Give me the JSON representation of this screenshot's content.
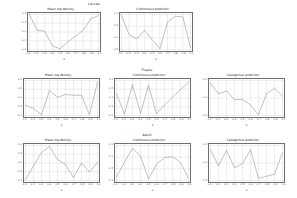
{
  "figure": {
    "background": "#ffffff",
    "line_color": "#8e8e8e",
    "grid_color": "#cfcfcf",
    "axis_color": "#6e6e6e"
  },
  "columns": {
    "density": "Mean log density",
    "continuous": "Continuous predictor",
    "categorical": "Categorical predictor"
  },
  "rows": {
    "larvae": "Larvae",
    "pupae": "Pupae",
    "adult": "Adult"
  },
  "axis": {
    "xlabel": "x"
  },
  "chart_data": [
    {
      "id": "larvae-density",
      "type": "line",
      "title": "Mean log density",
      "group": "Larvae",
      "xlabel": "x",
      "ylabel": "",
      "x": [
        0.1,
        0.2,
        0.3,
        0.4,
        0.5,
        0.6,
        0.7,
        0.8,
        0.9,
        1.0
      ],
      "xticklabels": [
        "0.1",
        "0.2",
        "0.3",
        "0.4",
        "0.5",
        "0.6",
        "0.7",
        "0.8",
        "0.9",
        "1.0"
      ],
      "values": [
        1.0,
        0.55,
        0.52,
        0.1,
        0.02,
        0.22,
        0.38,
        0.55,
        0.88,
        0.97
      ],
      "yticklabels": [
        "-0.4",
        "-0.2",
        "0.0",
        "0.2",
        "0.4"
      ],
      "ylim": [
        0,
        1
      ],
      "grid": true
    },
    {
      "id": "larvae-continuous",
      "type": "line",
      "title": "Continuous predictor",
      "group": "Larvae",
      "xlabel": "x",
      "ylabel": "",
      "x": [
        0.1,
        0.2,
        0.3,
        0.4,
        0.5,
        0.6,
        0.7,
        0.8,
        0.9,
        1.0
      ],
      "xticklabels": [
        "0.1",
        "0.2",
        "0.3",
        "0.4",
        "0.5",
        "0.6",
        "0.7",
        "0.8",
        "0.9",
        "1.0"
      ],
      "values": [
        0.98,
        0.42,
        0.3,
        0.55,
        0.28,
        0.02,
        0.78,
        0.95,
        0.93,
        0.05
      ],
      "yticklabels": [
        "-0.5",
        "0.0",
        "0.5",
        "1.0"
      ],
      "ylim": [
        0,
        1
      ],
      "grid": true
    },
    {
      "id": "pupae-density",
      "type": "line",
      "title": "Mean log density",
      "group": "Pupae",
      "xlabel": "x",
      "ylabel": "",
      "x": [
        0.1,
        0.2,
        0.3,
        0.4,
        0.5,
        0.6,
        0.7,
        0.8,
        0.9,
        1.0
      ],
      "xticklabels": [
        "0.1",
        "0.2",
        "0.3",
        "0.4",
        "0.5",
        "0.6",
        "0.7",
        "0.8",
        "0.9",
        "1.0"
      ],
      "values": [
        0.3,
        0.2,
        0.02,
        0.72,
        0.52,
        0.6,
        0.58,
        0.58,
        0.02,
        0.95
      ],
      "yticklabels": [
        "-1.0",
        "-0.5",
        "0.0",
        "0.5",
        "1.0"
      ],
      "ylim": [
        0,
        1
      ],
      "grid": true
    },
    {
      "id": "pupae-continuous",
      "type": "line",
      "title": "Continuous predictor",
      "group": "Pupae",
      "xlabel": "x",
      "ylabel": "",
      "x": [
        0.1,
        0.2,
        0.3,
        0.4,
        0.5,
        0.6,
        0.7,
        0.8,
        0.9,
        1.0
      ],
      "xticklabels": [
        "0.1",
        "0.2",
        "0.3",
        "0.4",
        "0.5",
        "0.6",
        "0.7",
        "0.8",
        "0.9",
        "1.0"
      ],
      "values": [
        0.62,
        0.04,
        0.88,
        0.06,
        0.86,
        0.05,
        0.3,
        0.52,
        0.74,
        0.95
      ],
      "yticklabels": [
        "-1.0",
        "-0.5",
        "0.0",
        "0.5",
        "1.0"
      ],
      "ylim": [
        0,
        1
      ],
      "grid": true
    },
    {
      "id": "pupae-categorical",
      "type": "line",
      "title": "Categorical predictor",
      "group": "Pupae",
      "xlabel": "x",
      "ylabel": "",
      "x": [
        0.1,
        0.2,
        0.3,
        0.4,
        0.5,
        0.6,
        0.7,
        0.8,
        0.9,
        1.0
      ],
      "xticklabels": [
        "0.1",
        "0.2",
        "0.3",
        "0.4",
        "0.5",
        "0.6",
        "0.7",
        "0.8",
        "0.9",
        "1.0"
      ],
      "values": [
        0.92,
        0.62,
        0.7,
        0.45,
        0.46,
        0.3,
        0.02,
        0.62,
        0.78,
        0.56
      ],
      "yticklabels": [
        "-0.5",
        "0.0",
        "0.5"
      ],
      "ylim": [
        0,
        1
      ],
      "grid": true
    },
    {
      "id": "adult-density",
      "type": "line",
      "title": "Mean log density",
      "group": "Adult",
      "xlabel": "x",
      "ylabel": "",
      "x": [
        0.1,
        0.2,
        0.3,
        0.4,
        0.5,
        0.6,
        0.7,
        0.8,
        0.9,
        1.0
      ],
      "xticklabels": [
        "0.1",
        "0.2",
        "0.3",
        "0.4",
        "0.5",
        "0.6",
        "0.7",
        "0.8",
        "0.9",
        "1.0"
      ],
      "values": [
        0.02,
        0.42,
        0.8,
        0.97,
        0.6,
        0.46,
        0.08,
        0.5,
        0.24,
        0.52
      ],
      "yticklabels": [
        "-1.0",
        "-0.5",
        "0.0",
        "0.5",
        "1.0"
      ],
      "ylim": [
        0,
        1
      ],
      "grid": true
    },
    {
      "id": "adult-continuous",
      "type": "line",
      "title": "Continuous predictor",
      "group": "Adult",
      "xlabel": "x",
      "ylabel": "",
      "x": [
        0.1,
        0.2,
        0.3,
        0.4,
        0.5,
        0.6,
        0.7,
        0.8,
        0.9,
        1.0
      ],
      "xticklabels": [
        "0.1",
        "0.2",
        "0.3",
        "0.4",
        "0.5",
        "0.6",
        "0.7",
        "0.8",
        "0.9",
        "1.0"
      ],
      "values": [
        0.1,
        0.52,
        0.92,
        0.7,
        0.04,
        0.46,
        0.66,
        0.68,
        0.52,
        0.06
      ],
      "yticklabels": [
        "-1.0",
        "-0.5",
        "0.0",
        "0.5"
      ],
      "ylim": [
        0,
        1
      ],
      "grid": true
    },
    {
      "id": "adult-categorical",
      "type": "line",
      "title": "Categorical predictor",
      "group": "Adult",
      "xlabel": "x",
      "ylabel": "",
      "x": [
        0.1,
        0.2,
        0.3,
        0.4,
        0.5,
        0.6,
        0.7,
        0.8,
        0.9,
        1.0
      ],
      "xticklabels": [
        "0.1",
        "0.2",
        "0.3",
        "0.4",
        "0.5",
        "0.6",
        "0.7",
        "0.8",
        "0.9",
        "1.0"
      ],
      "values": [
        0.88,
        0.42,
        0.86,
        0.36,
        0.48,
        0.88,
        0.06,
        0.12,
        0.18,
        0.8
      ],
      "yticklabels": [
        "-0.5",
        "0.0",
        "0.5"
      ],
      "ylim": [
        0,
        1
      ],
      "grid": true
    }
  ]
}
